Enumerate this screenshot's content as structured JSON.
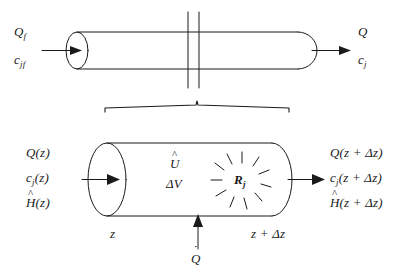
{
  "figure": {
    "stroke_color": "#1a1a1a",
    "background_color": "#ffffff"
  },
  "top_tube": {
    "name": "full-length-reactor-tube",
    "inlet": {
      "flow_label": "Q",
      "flow_sub": "f",
      "conc_label": "c",
      "conc_sub": "jf"
    },
    "outlet": {
      "flow_label": "Q",
      "flow_sub": "",
      "conc_label": "c",
      "conc_sub": "j"
    },
    "break_marks": 2
  },
  "brace": {
    "name": "expansion-brace",
    "label": ""
  },
  "control_volume": {
    "name": "differential-control-volume",
    "inlet": {
      "flow": "Q(z)",
      "conc_base": "c",
      "conc_sub": "j",
      "conc_arg": "(z)",
      "enthalpy_base": "H",
      "enthalpy_arg": "(z)"
    },
    "outlet": {
      "flow": "Q(z + Δz)",
      "conc_base": "c",
      "conc_sub": "j",
      "conc_arg": "(z + Δz)",
      "enthalpy_base": "H",
      "enthalpy_arg": "(z + Δz)"
    },
    "interior": {
      "internal_energy": "U",
      "volume": "ΔV",
      "reaction_rate_base": "R",
      "reaction_rate_sub": "j",
      "starburst_rays": 11
    },
    "axis": {
      "left_position": "z",
      "right_position": "z + Δz"
    },
    "heat": {
      "symbol": "Q",
      "accent": "dot",
      "direction": "up"
    }
  },
  "icons": {
    "inlet_arrow": "arrow-right-icon",
    "outlet_arrow": "arrow-right-icon",
    "heat_arrow": "arrow-up-icon",
    "break_mark": "break-mark-icon",
    "starburst": "starburst-icon"
  }
}
